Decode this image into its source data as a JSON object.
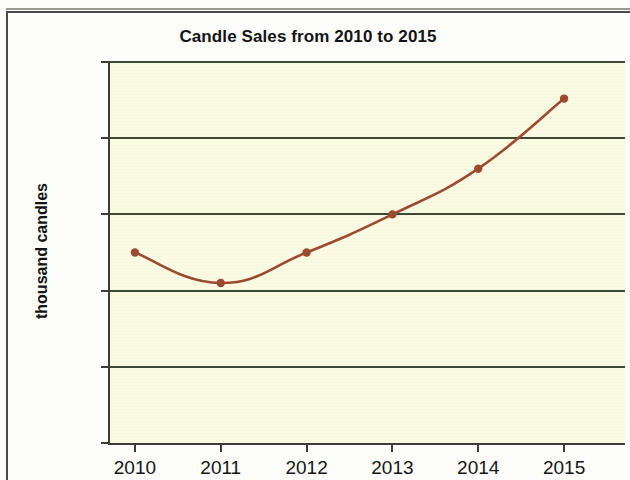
{
  "chart_data": {
    "type": "line",
    "title": "Candle Sales from 2010 to 2015",
    "xlabel": "",
    "ylabel": "thousand candles",
    "categories": [
      "2010",
      "2011",
      "2012",
      "2013",
      "2014",
      "2015"
    ],
    "values": [
      850,
      810,
      850,
      900,
      960,
      1052
    ],
    "series": [
      {
        "name": "Candle sales",
        "values": [
          850,
          810,
          850,
          900,
          960,
          1052
        ]
      }
    ],
    "ylim": [
      600,
      1100
    ],
    "y_ticks": [
      "1100",
      "1000",
      "900",
      "800",
      "700",
      "600"
    ],
    "y_tick_values": [
      1100,
      1000,
      900,
      800,
      700,
      600
    ],
    "grid": "horizontal",
    "legend": "none",
    "marker": "circle",
    "line_color": "#9c4a32",
    "marker_color": "#9c4a32",
    "plot_background": "#fbfbe2",
    "gridline_color": "#3f4a36",
    "axis_color": "#3c3c3c",
    "page_background": "#fdfdfb"
  },
  "figure": {
    "title": "Candle Sales from 2010 to 2015",
    "y_axis_title": "thousand candles"
  }
}
